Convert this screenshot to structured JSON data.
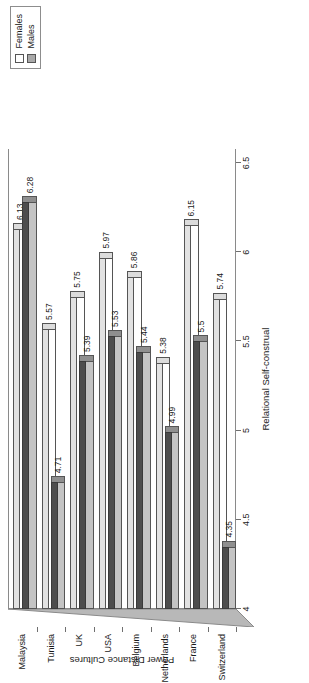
{
  "chart_data": {
    "type": "bar",
    "orientation": "horizontal",
    "title": "",
    "xlabel": "Relational Self-construal",
    "ylabel": "Power Distance Cultures",
    "xlim": [
      4,
      6.5
    ],
    "xticks": [
      "4",
      "4.5",
      "5",
      "5.5",
      "6",
      "6.5"
    ],
    "xtick_values": [
      4,
      4.5,
      5,
      5.5,
      6,
      6.5
    ],
    "grid": false,
    "legend_position": "top-right",
    "categories": [
      "Switzerland",
      "France",
      "Netherlands",
      "Belgium",
      "USA",
      "UK",
      "Tunisia",
      "Malaysia"
    ],
    "series": [
      {
        "name": "Females",
        "color": "#ffffff",
        "values": [
          5.74,
          6.15,
          5.38,
          5.86,
          5.97,
          5.75,
          5.57,
          6.13
        ],
        "labels": [
          "5.74",
          "6.15",
          "5.38",
          "5.86",
          "5.97",
          "5.75",
          "5.57",
          "6.13"
        ]
      },
      {
        "name": "Males",
        "color": "#c4c4c4",
        "values": [
          4.35,
          5.5,
          4.99,
          5.44,
          5.53,
          5.39,
          4.71,
          6.28
        ],
        "labels": [
          "4.35",
          "5.5",
          "4.99",
          "5.44",
          "5.53",
          "5.39",
          "4.71",
          "6.28"
        ]
      }
    ]
  },
  "legend": {
    "items": [
      {
        "label": "Females",
        "marker": "open-square-marker"
      },
      {
        "label": "Males",
        "marker": "filled-square-marker"
      }
    ]
  },
  "axes": {
    "value_axis_title": "Relational Self-construal",
    "category_axis_title": "Power Distance Cultures"
  }
}
